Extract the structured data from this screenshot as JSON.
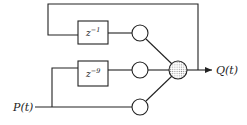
{
  "diagram": {
    "input_label": "P(t)",
    "output_label": "Q(t)",
    "delay_blocks": [
      {
        "base": "z",
        "exponent": "−1"
      },
      {
        "base": "z",
        "exponent": "−9"
      }
    ],
    "weight_nodes": 3,
    "summation_node": "stippled",
    "colors": {
      "line": "#222222",
      "stipple": "#9a9a9a",
      "background": "#ffffff"
    }
  }
}
